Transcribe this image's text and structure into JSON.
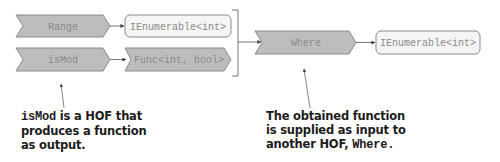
{
  "diagram": {
    "colors": {
      "function_fill": "#bdbdbd",
      "function_stroke": "#8c8c8c",
      "value_fill": "#f5f5f5",
      "value_stroke": "#8c8c8c",
      "node_text": "#8a8a8a",
      "line": "#555555",
      "caption_text": "#1c1c1c"
    },
    "nodes": {
      "range": {
        "label": "Range",
        "kind": "function"
      },
      "range_output": {
        "label": "IEnumerable<int>",
        "kind": "value"
      },
      "is_mod": {
        "label": "isMod",
        "kind": "function"
      },
      "is_mod_output": {
        "label": "Func<int, bool>",
        "kind": "function"
      },
      "where": {
        "label": "Where",
        "kind": "function"
      },
      "where_output": {
        "label": "IEnumerable<int>",
        "kind": "value"
      }
    },
    "edges": [
      {
        "from": "range",
        "to": "range_output"
      },
      {
        "from": "is_mod",
        "to": "is_mod_output"
      },
      {
        "from": "range_output+is_mod_output",
        "to": "where",
        "via": "bracket"
      },
      {
        "from": "where",
        "to": "where_output"
      }
    ],
    "annotations": {
      "left": {
        "code": "isMod",
        "line1_rest": " is a HOF that",
        "line2": "produces a function",
        "line3": "as output.",
        "points_to": "is_mod"
      },
      "right": {
        "line1": "The obtained function",
        "line2": "is supplied as input to",
        "line3_prefix": "another HOF, ",
        "code": "Where.",
        "points_to": "where"
      }
    }
  }
}
